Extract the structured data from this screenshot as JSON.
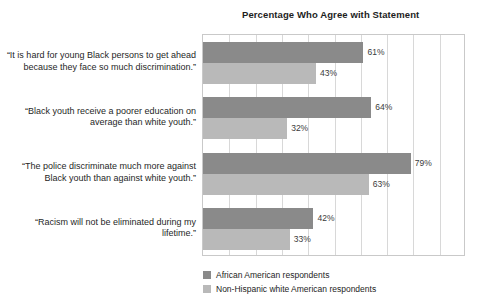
{
  "chart_data": {
    "type": "bar",
    "orientation": "horizontal",
    "title": "Percentage Who Agree with Statement",
    "xlabel": "",
    "ylabel": "",
    "xlim": [
      0,
      100
    ],
    "xtick_step": 10,
    "grid": true,
    "xticklabels_visible": false,
    "legend_position": "bottom-left",
    "categories": [
      "“It is hard for young Black persons to get ahead because they face so much discrimination.”",
      "“Black youth receive a poorer education on average than white youth.”",
      "“The police discriminate much more against Black youth than against white youth.”",
      "“Racism will not be eliminated during my lifetime.”"
    ],
    "series": [
      {
        "name": "African American respondents",
        "color": "#8a8a8a",
        "values": [
          61,
          64,
          79,
          42
        ],
        "labels": [
          "61%",
          "64%",
          "79%",
          "42%"
        ]
      },
      {
        "name": "Non-Hispanic white American respondents",
        "color": "#b9b9b9",
        "values": [
          43,
          32,
          63,
          33
        ],
        "labels": [
          "43%",
          "32%",
          "63%",
          "33%"
        ]
      }
    ]
  },
  "legend": {
    "items": [
      {
        "label": "African American respondents"
      },
      {
        "label": "Non-Hispanic white American respondents"
      }
    ]
  }
}
